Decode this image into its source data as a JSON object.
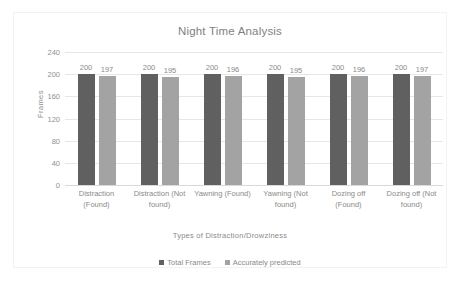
{
  "chart_data": {
    "type": "bar",
    "title": "Night Time Analysis",
    "xlabel": "Types of Distraction/Drowziness",
    "ylabel": "Frames",
    "ylim": [
      0,
      240
    ],
    "yticks": [
      240,
      200,
      160,
      120,
      80,
      40,
      0
    ],
    "grid": true,
    "legend_position": "bottom",
    "categories": [
      "Distraction (Found)",
      "Distraction (Not found)",
      "Yawning (Found)",
      "Yawning (Not found)",
      "Dozing off (Found)",
      "Dozing off (Not found)"
    ],
    "series": [
      {
        "name": "Total Frames",
        "color": "#606060",
        "values": [
          200,
          200,
          200,
          200,
          200,
          200
        ]
      },
      {
        "name": "Accurately predicted",
        "color": "#a3a3a3",
        "values": [
          197,
          195,
          196,
          195,
          196,
          197
        ]
      }
    ]
  }
}
